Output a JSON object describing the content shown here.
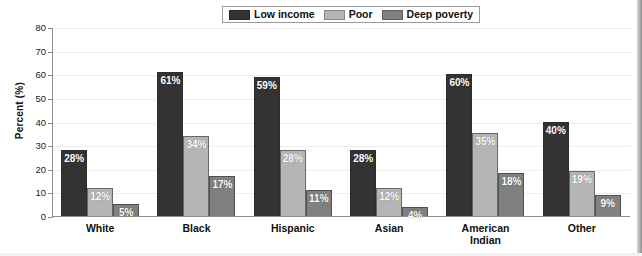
{
  "chart_data": {
    "type": "bar",
    "title": "",
    "xlabel": "",
    "ylabel": "Percent (%)",
    "ylim": [
      0,
      80
    ],
    "yticks": [
      0,
      10,
      20,
      30,
      40,
      50,
      60,
      70,
      80
    ],
    "grid": true,
    "legend_position": "top-center",
    "categories": [
      "White",
      "Black",
      "Hispanic",
      "Asian",
      "American\nIndian",
      "Other"
    ],
    "series": [
      {
        "name": "Low income",
        "color": "#333333",
        "values": [
          28,
          61,
          59,
          28,
          60,
          40
        ],
        "labels": [
          "28%",
          "61%",
          "59%",
          "28%",
          "60%",
          "40%"
        ]
      },
      {
        "name": "Poor",
        "color": "#b5b5b5",
        "values": [
          12,
          34,
          28,
          12,
          35,
          19
        ],
        "labels": [
          "12%",
          "34%",
          "28%",
          "12%",
          "35%",
          "19%"
        ]
      },
      {
        "name": "Deep poverty",
        "color": "#808080",
        "values": [
          5,
          17,
          11,
          4,
          18,
          9
        ],
        "labels": [
          "5%",
          "17%",
          "11%",
          "4%",
          "18%",
          "9%"
        ]
      }
    ]
  },
  "legend": {
    "items": [
      {
        "label": "Low income",
        "swatch": "legend-swatch-low-income"
      },
      {
        "label": "Poor",
        "swatch": "legend-swatch-poor"
      },
      {
        "label": "Deep poverty",
        "swatch": "legend-swatch-deep-poverty"
      }
    ]
  },
  "axes": {
    "y_title": "Percent (%)",
    "y_tick_labels": [
      "0",
      "10",
      "20",
      "30",
      "40",
      "50",
      "60",
      "70",
      "80"
    ],
    "x_tick_labels": [
      "White",
      "Black",
      "Hispanic",
      "Asian",
      "American\nIndian",
      "Other"
    ]
  },
  "colors": {
    "low_income": "#333333",
    "poor": "#b5b5b5",
    "deep_poverty": "#808080",
    "gridline": "#ededed",
    "axis": "#8d8d8d",
    "background": "#ffffff"
  }
}
